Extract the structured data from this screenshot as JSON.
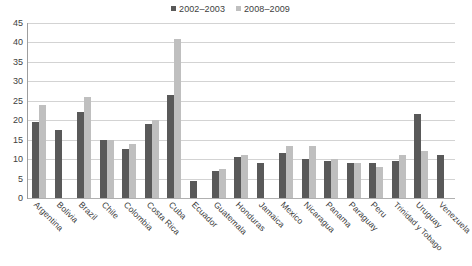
{
  "chart_data": {
    "type": "bar",
    "title": "",
    "subtitle": "",
    "xlabel": "",
    "ylabel": "",
    "ylim": [
      0,
      45
    ],
    "ytick_step": 5,
    "yticks": [
      "45",
      "40",
      "35",
      "30",
      "25",
      "20",
      "15",
      "10",
      "5",
      "0"
    ],
    "grid": true,
    "legend_position": "top-center",
    "categories": [
      "Argentina",
      "Bolivia",
      "Brazil",
      "Chile",
      "Colombia",
      "Costa Rica",
      "Cuba",
      "Ecuador",
      "Guatemala",
      "Honduras",
      "Jamaica",
      "Mexico",
      "Nicaragua",
      "Panama",
      "Paraguay",
      "Peru",
      "Trinidad y Tobago",
      "Uruguay",
      "Venezuela"
    ],
    "series": [
      {
        "name": "2002–2003",
        "color": "#595959",
        "values": [
          19.5,
          17.5,
          22,
          15,
          12.5,
          19,
          26.5,
          4.5,
          7,
          10.5,
          9,
          11.5,
          10,
          9.5,
          9,
          9,
          9.5,
          21.5,
          11
        ]
      },
      {
        "name": "2008–2009",
        "color": "#bfbfbf",
        "values": [
          24,
          null,
          26,
          15,
          14,
          20,
          41,
          null,
          7.5,
          11,
          null,
          13.5,
          13.5,
          10,
          9,
          8,
          11,
          12,
          null
        ]
      }
    ]
  },
  "legend": {
    "entries": [
      {
        "label": "2002–2003",
        "color": "#595959"
      },
      {
        "label": "2008–2009",
        "color": "#bfbfbf"
      }
    ]
  }
}
